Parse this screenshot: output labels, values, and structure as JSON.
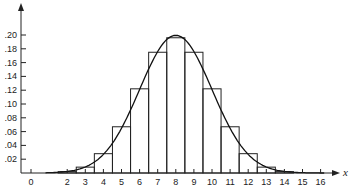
{
  "chart_data": {
    "type": "bar",
    "title": "",
    "xlabel": "x",
    "ylabel": "",
    "categories": [
      2,
      3,
      4,
      5,
      6,
      7,
      8,
      9,
      10,
      11,
      12,
      13,
      14
    ],
    "values": [
      0.002,
      0.0085,
      0.028,
      0.067,
      0.122,
      0.175,
      0.196,
      0.175,
      0.122,
      0.067,
      0.028,
      0.0085,
      0.002
    ],
    "series": [
      {
        "name": "binomial probabilities",
        "type": "bar",
        "x": [
          2,
          3,
          4,
          5,
          6,
          7,
          8,
          9,
          10,
          11,
          12,
          13,
          14
        ],
        "values": [
          0.002,
          0.0085,
          0.028,
          0.067,
          0.122,
          0.175,
          0.196,
          0.175,
          0.122,
          0.067,
          0.028,
          0.0085,
          0.002
        ]
      },
      {
        "name": "normal approximation",
        "type": "line",
        "mean": 8,
        "sd": 2
      }
    ],
    "x_ticks": [
      "0",
      "2",
      "3",
      "4",
      "5",
      "6",
      "7",
      "8",
      "9",
      "10",
      "11",
      "12",
      "13",
      "14",
      "15",
      "16"
    ],
    "y_ticks": [
      ".02",
      ".04",
      ".06",
      ".08",
      ".10",
      ".12",
      ".14",
      ".16",
      ".18",
      ".20"
    ],
    "xlim": [
      0,
      16.5
    ],
    "ylim": [
      0,
      0.22
    ],
    "grid": false,
    "legend": null
  }
}
